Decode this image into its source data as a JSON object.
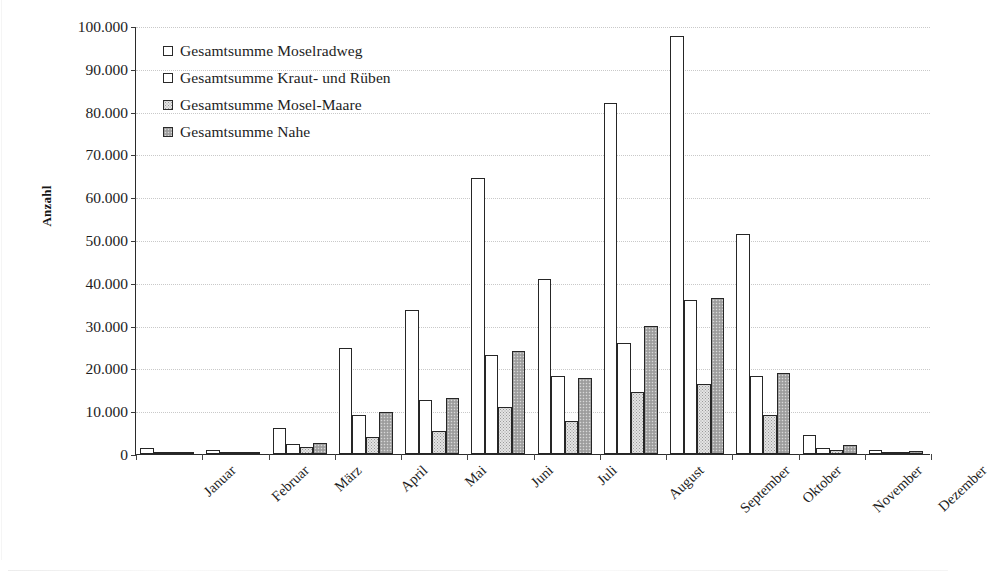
{
  "chart_data": {
    "type": "bar",
    "title": "",
    "xlabel": "",
    "ylabel": "Anzahl",
    "ylim": [
      0,
      100000
    ],
    "ytick_step": 10000,
    "grid": true,
    "legend_position": "top-left inside plot",
    "categories": [
      "Januar",
      "Februar",
      "März",
      "April",
      "Mai",
      "Juni",
      "Juli",
      "August",
      "September",
      "Oktober",
      "November",
      "Dezember"
    ],
    "ytick_labels": [
      "0",
      "10.000",
      "20.000",
      "30.000",
      "40.000",
      "50.000",
      "60.000",
      "70.000",
      "80.000",
      "90.000",
      "100.000"
    ],
    "ytick_values": [
      0,
      10000,
      20000,
      30000,
      40000,
      50000,
      60000,
      70000,
      80000,
      90000,
      100000
    ],
    "series": [
      {
        "name": "Gesamtsumme Moselradweg",
        "swatch": "#ffffff",
        "values": [
          1400,
          1000,
          6000,
          24700,
          33700,
          64500,
          40900,
          82000,
          97700,
          51500,
          4500,
          900
        ]
      },
      {
        "name": "Gesamtsumme Kraut- und Rüben",
        "swatch": "#ffffff",
        "values": [
          500,
          500,
          2400,
          9200,
          12700,
          23100,
          18300,
          25900,
          36000,
          18300,
          1400,
          500
        ]
      },
      {
        "name": "Gesamtsumme Mosel-Maare",
        "swatch": "#e3e3e3",
        "values": [
          400,
          400,
          1600,
          4000,
          5400,
          10900,
          7800,
          14400,
          16400,
          9200,
          900,
          400
        ]
      },
      {
        "name": "Gesamtsumme Nahe",
        "swatch": "#a8a8a8",
        "values": [
          500,
          500,
          2500,
          9900,
          13200,
          24100,
          17700,
          29900,
          36500,
          18900,
          2000,
          600
        ]
      }
    ]
  },
  "axis": {
    "y_title": "Anzahl"
  }
}
